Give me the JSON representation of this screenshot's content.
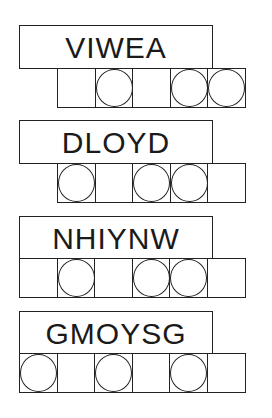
{
  "puzzles": [
    {
      "clue": "VIWEA",
      "cell_count": 5,
      "circled": [
        false,
        true,
        false,
        true,
        true
      ],
      "answer": [
        "",
        "",
        "",
        "",
        ""
      ]
    },
    {
      "clue": "DLOYD",
      "cell_count": 5,
      "circled": [
        true,
        false,
        true,
        true,
        false
      ],
      "answer": [
        "",
        "",
        "",
        "",
        ""
      ]
    },
    {
      "clue": "NHIYNW",
      "cell_count": 6,
      "circled": [
        false,
        true,
        false,
        true,
        true,
        false
      ],
      "answer": [
        "",
        "",
        "",
        "",
        "",
        ""
      ]
    },
    {
      "clue": "GMOYSG",
      "cell_count": 6,
      "circled": [
        true,
        false,
        true,
        false,
        true,
        false
      ],
      "answer": [
        "",
        "",
        "",
        "",
        "",
        ""
      ]
    }
  ]
}
